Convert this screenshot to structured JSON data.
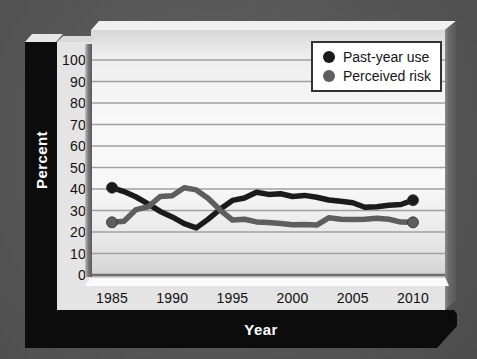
{
  "figure": {
    "y_axis_title": "Percent",
    "x_axis_title": "Year"
  },
  "chart_data": {
    "type": "line",
    "title": "",
    "xlabel": "Year",
    "ylabel": "Percent",
    "x": [
      1985,
      1986,
      1987,
      1988,
      1989,
      1990,
      1991,
      1992,
      1993,
      1994,
      1995,
      1996,
      1997,
      1998,
      1999,
      2000,
      2001,
      2002,
      2003,
      2004,
      2005,
      2006,
      2007,
      2008,
      2009,
      2010
    ],
    "series": [
      {
        "name": "Past-year use",
        "color": "#1b1b1b",
        "values": [
          40.6,
          38.8,
          36.3,
          33.1,
          29.6,
          27.0,
          23.9,
          21.9,
          26.0,
          30.7,
          34.7,
          35.8,
          38.5,
          37.5,
          37.8,
          36.5,
          37.0,
          36.2,
          34.9,
          34.3,
          33.6,
          31.5,
          31.7,
          32.4,
          32.8,
          34.8
        ]
      },
      {
        "name": "Perceived risk",
        "color": "#5e5e5e",
        "values": [
          24.5,
          25.0,
          30.4,
          31.7,
          36.5,
          36.9,
          40.6,
          39.6,
          35.6,
          30.1,
          25.6,
          25.9,
          24.7,
          24.4,
          23.9,
          23.4,
          23.5,
          23.2,
          26.6,
          25.9,
          25.8,
          25.9,
          26.4,
          25.9,
          24.6,
          24.5
        ]
      }
    ],
    "ylim": [
      0,
      100
    ],
    "yticks": [
      0,
      10,
      20,
      30,
      40,
      50,
      60,
      70,
      80,
      90,
      100
    ],
    "xticks": [
      1985,
      1990,
      1995,
      2000,
      2005,
      2010
    ],
    "grid": "horizontal",
    "legend_position": "top-right",
    "endpoint_markers": true
  },
  "colors": {
    "frame": "#0c0c0c",
    "canvas_background": "#565656",
    "plot_background": "#f6f6f6",
    "gridline": "#a0a0a0",
    "axis_label_text": "#111111",
    "axis_title_text": "#ffffff",
    "legend_border": "#333333"
  }
}
